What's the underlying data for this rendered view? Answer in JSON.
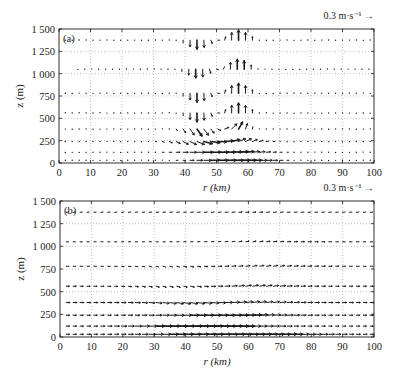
{
  "chart_data": [
    {
      "type": "quiver",
      "panel_label": "(a)",
      "xlabel": "r (km)",
      "ylabel": "z (m)",
      "xlim": [
        0,
        100
      ],
      "ylim": [
        0,
        1500
      ],
      "xticks": [
        0,
        10,
        20,
        30,
        40,
        50,
        60,
        70,
        80,
        90,
        100
      ],
      "yticks": [
        0,
        250,
        500,
        750,
        1000,
        1250,
        1500
      ],
      "ytick_labels": [
        "0",
        "250",
        "500",
        "750",
        "1 000",
        "1 250",
        "1 500"
      ],
      "grid": true,
      "reference_vector": {
        "label": "0.3 m·s⁻¹",
        "magnitude": 0.3
      },
      "rows": [
        {
          "z": 1375,
          "start_r": 2,
          "description": "downward arrows near r=40-48 km, upward arrows near r=52-62 km"
        },
        {
          "z": 1050,
          "start_r": 6,
          "description": "downward near 40-48 km, upward near 53-62 km"
        },
        {
          "z": 780,
          "start_r": 2,
          "description": "downward near 40-48 km, upward near 52-62 km"
        },
        {
          "z": 560,
          "start_r": 2,
          "description": "downward near 40-48 km, upward near 52-62 km"
        },
        {
          "z": 380,
          "start_r": 2,
          "description": "down-right slanted near 38-50 km, up-right near 53-62 km"
        },
        {
          "z": 240,
          "start_r": 2,
          "description": "strong outflow/inflow slanted arrows 30-65 km"
        },
        {
          "z": 120,
          "start_r": 2,
          "description": "strong horizontal arrows 35-68 km"
        },
        {
          "z": 30,
          "start_r": 2,
          "description": "strong horizontal near-surface arrows 40-70 km"
        }
      ],
      "features": {
        "downdraft_r": [
          40,
          48
        ],
        "updraft_r": [
          52,
          62
        ]
      }
    },
    {
      "type": "quiver",
      "panel_label": "(b)",
      "xlabel": "r (km)",
      "ylabel": "z (m)",
      "xlim": [
        0,
        100
      ],
      "ylim": [
        0,
        1500
      ],
      "xticks": [
        0,
        10,
        20,
        30,
        40,
        50,
        60,
        70,
        80,
        90,
        100
      ],
      "yticks": [
        0,
        250,
        500,
        750,
        1000,
        1250,
        1500
      ],
      "ytick_labels": [
        "0",
        "250",
        "500",
        "750",
        "1 000",
        "1 250",
        "1 500"
      ],
      "grid": true,
      "reference_vector": {
        "label": "0.3 m·s⁻¹",
        "magnitude": 0.3
      },
      "rows": [
        {
          "z": 1375,
          "start_r": 2,
          "description": "weak nearly horizontal arrows"
        },
        {
          "z": 1050,
          "start_r": 2,
          "description": "weak arrows"
        },
        {
          "z": 780,
          "start_r": 2,
          "description": "weak slanted arrows"
        },
        {
          "z": 560,
          "start_r": 2,
          "description": "weak slanted arrows, slightly stronger beyond 50 km"
        },
        {
          "z": 380,
          "start_r": 2,
          "description": "moderate slanted arrows 20-80 km"
        },
        {
          "z": 240,
          "start_r": 2,
          "description": "moderate horizontal arrows, stronger 30-70 km"
        },
        {
          "z": 120,
          "start_r": 2,
          "description": "strong horizontal arrows 25-70 km"
        },
        {
          "z": 30,
          "start_r": 2,
          "description": "strong horizontal near-surface arrows 20-75 km"
        }
      ]
    }
  ],
  "figure": {
    "panels": [
      {
        "label": "(a)",
        "scale_label": "0.3 m·s⁻¹ →",
        "xlabel": "r (km)",
        "ylabel": "z (m)"
      },
      {
        "label": "(b)",
        "scale_label": "0.3 m·s⁻¹ →",
        "xlabel": "r (km)",
        "ylabel": "z (m)"
      }
    ],
    "xtick_labels": [
      "0",
      "10",
      "20",
      "30",
      "40",
      "50",
      "60",
      "70",
      "80",
      "90",
      "100"
    ],
    "ytick_labels": [
      "0",
      "250",
      "500",
      "750",
      "1 000",
      "1 250",
      "1 500"
    ],
    "ink_color": "#1a1a1a",
    "grid_color": "#9a9a9a"
  }
}
